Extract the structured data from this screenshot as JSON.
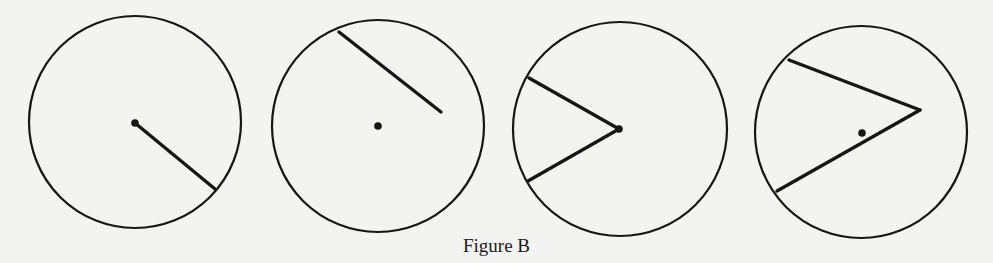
{
  "figure": {
    "caption": "Figure B",
    "stroke_color": "#161616",
    "background": "#f3f3f1",
    "panels": [
      {
        "id": "circle-1",
        "description": "Circle with a radius drawn from the center",
        "circle": {
          "cx": 135,
          "cy": 122,
          "r": 106
        },
        "center_dot": {
          "cx": 135,
          "cy": 123
        },
        "segments": [
          {
            "x1": 135,
            "y1": 123,
            "x2": 215,
            "y2": 189
          }
        ]
      },
      {
        "id": "circle-2",
        "description": "Circle with center dot and a segment from the circumference not through the center",
        "circle": {
          "cx": 378,
          "cy": 126,
          "r": 106
        },
        "center_dot": {
          "cx": 378,
          "cy": 126
        },
        "segments": [
          {
            "x1": 339,
            "y1": 32,
            "x2": 441,
            "y2": 112
          }
        ]
      },
      {
        "id": "circle-3",
        "description": "Central angle: two radii meeting at the center",
        "circle": {
          "cx": 620,
          "cy": 129,
          "r": 107
        },
        "center_dot": {
          "cx": 619,
          "cy": 129
        },
        "segments": [
          {
            "x1": 619,
            "y1": 129,
            "x2": 529,
            "y2": 78
          },
          {
            "x1": 619,
            "y1": 129,
            "x2": 528,
            "y2": 181
          }
        ]
      },
      {
        "id": "circle-4",
        "description": "Angle with vertex inside the circle but not at the center",
        "circle": {
          "cx": 861,
          "cy": 132,
          "r": 106
        },
        "center_dot": {
          "cx": 862,
          "cy": 133
        },
        "segments": [
          {
            "x1": 920,
            "y1": 110,
            "x2": 789,
            "y2": 60
          },
          {
            "x1": 920,
            "y1": 110,
            "x2": 777,
            "y2": 191
          }
        ]
      }
    ]
  }
}
